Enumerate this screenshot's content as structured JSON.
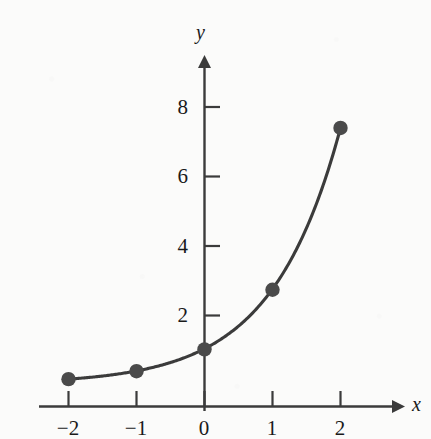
{
  "chart_data": {
    "type": "line",
    "title": "",
    "subtitle": "",
    "xlabel": "x",
    "ylabel": "y",
    "x": [
      -2,
      -1,
      0,
      1,
      2
    ],
    "values": [
      0.14,
      0.37,
      1.0,
      2.72,
      7.39
    ],
    "series": [
      {
        "name": "exponential curve",
        "x": [
          -2,
          -1,
          0,
          1,
          2
        ],
        "values": [
          0.14,
          0.37,
          1.0,
          2.72,
          7.39
        ]
      }
    ],
    "markers": [
      {
        "x": -2,
        "y": 0.14
      },
      {
        "x": -1,
        "y": 0.37
      },
      {
        "x": 0,
        "y": 1.0
      },
      {
        "x": 1,
        "y": 2.72
      },
      {
        "x": 2,
        "y": 7.39
      }
    ],
    "x_ticks": [
      -2,
      -1,
      0,
      1,
      2
    ],
    "x_tick_labels": [
      "−2",
      "−1",
      "0",
      "1",
      "2"
    ],
    "y_ticks": [
      2,
      4,
      6,
      8
    ],
    "y_tick_labels": [
      "2",
      "4",
      "6",
      "8"
    ],
    "xlim": [
      -2.6,
      2.9
    ],
    "ylim": [
      -0.7,
      9.4
    ],
    "grid": false,
    "legend": null,
    "legend_position": "none",
    "annotations": [],
    "curve_color": "#3b3b3b",
    "axis_color": "#3b3b3b",
    "marker_color": "#4a4a4a",
    "background_color": "#fbfbfa"
  },
  "axes": {
    "y_axis_label": "y",
    "x_axis_label": "x"
  },
  "ticks": {
    "y": [
      {
        "label": "8",
        "value": 8
      },
      {
        "label": "6",
        "value": 6
      },
      {
        "label": "4",
        "value": 4
      },
      {
        "label": "2",
        "value": 2
      }
    ],
    "x": [
      {
        "label": "−2",
        "value": -2
      },
      {
        "label": "−1",
        "value": -1
      },
      {
        "label": "0",
        "value": 0
      },
      {
        "label": "1",
        "value": 1
      },
      {
        "label": "2",
        "value": 2
      }
    ]
  }
}
